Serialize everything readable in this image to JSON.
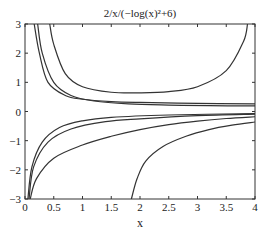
{
  "chart_data": {
    "type": "line",
    "title": "2/x/(−log(x)²+6)",
    "xlabel": "x",
    "ylabel": "",
    "xlim": [
      0,
      4
    ],
    "ylim": [
      -3,
      3
    ],
    "grid": false,
    "legend": null,
    "x_ticks": [
      "0",
      "0.5",
      "1",
      "1.5",
      "2",
      "2.5",
      "3",
      "3.5",
      "4"
    ],
    "y_ticks": [
      "3",
      "2",
      "1",
      "0",
      "−1",
      "−2",
      "−3"
    ],
    "series": [
      {
        "name": "curve-u",
        "points": [
          [
            0.43,
            3.0
          ],
          [
            0.5,
            2.3
          ],
          [
            0.7,
            1.3
          ],
          [
            1.0,
            0.85
          ],
          [
            1.5,
            0.66
          ],
          [
            2.0,
            0.64
          ],
          [
            2.5,
            0.68
          ],
          [
            3.0,
            0.85
          ],
          [
            3.5,
            1.4
          ],
          [
            3.8,
            2.4
          ],
          [
            3.87,
            3.0
          ]
        ]
      },
      {
        "name": "curve-upper-1",
        "points": [
          [
            0.16,
            3.0
          ],
          [
            0.25,
            2.0
          ],
          [
            0.4,
            1.0
          ],
          [
            0.7,
            0.55
          ],
          [
            1.0,
            0.42
          ],
          [
            1.5,
            0.34
          ],
          [
            2.0,
            0.31
          ],
          [
            3.0,
            0.28
          ],
          [
            4.0,
            0.26
          ]
        ]
      },
      {
        "name": "curve-upper-2",
        "points": [
          [
            0.22,
            3.0
          ],
          [
            0.3,
            2.0
          ],
          [
            0.5,
            1.0
          ],
          [
            0.8,
            0.55
          ],
          [
            1.2,
            0.36
          ],
          [
            1.8,
            0.26
          ],
          [
            2.5,
            0.22
          ],
          [
            3.2,
            0.2
          ],
          [
            4.0,
            0.19
          ]
        ]
      },
      {
        "name": "curve-lower-1",
        "points": [
          [
            0.05,
            -3.0
          ],
          [
            0.12,
            -1.9
          ],
          [
            0.3,
            -1.05
          ],
          [
            0.6,
            -0.55
          ],
          [
            1.0,
            -0.32
          ],
          [
            1.5,
            -0.2
          ],
          [
            2.5,
            -0.12
          ],
          [
            4.0,
            -0.07
          ]
        ]
      },
      {
        "name": "curve-lower-2",
        "points": [
          [
            0.07,
            -3.0
          ],
          [
            0.15,
            -1.9
          ],
          [
            0.4,
            -1.05
          ],
          [
            0.8,
            -0.6
          ],
          [
            1.4,
            -0.35
          ],
          [
            2.0,
            -0.25
          ],
          [
            3.0,
            -0.14
          ],
          [
            4.0,
            -0.09
          ]
        ]
      },
      {
        "name": "curve-lower-3",
        "points": [
          [
            0.09,
            -3.0
          ],
          [
            0.2,
            -2.3
          ],
          [
            0.5,
            -1.6
          ],
          [
            1.0,
            -1.15
          ],
          [
            1.5,
            -0.85
          ],
          [
            2.0,
            -0.62
          ],
          [
            2.5,
            -0.45
          ],
          [
            3.0,
            -0.33
          ],
          [
            3.5,
            -0.24
          ],
          [
            4.0,
            -0.18
          ]
        ]
      },
      {
        "name": "curve-lower-4",
        "points": [
          [
            1.85,
            -3.0
          ],
          [
            1.95,
            -2.3
          ],
          [
            2.1,
            -1.7
          ],
          [
            2.4,
            -1.2
          ],
          [
            2.8,
            -0.85
          ],
          [
            3.2,
            -0.62
          ],
          [
            3.6,
            -0.47
          ],
          [
            4.0,
            -0.36
          ]
        ]
      }
    ]
  },
  "plot": {
    "left": 25,
    "right": 255,
    "top": 24,
    "bottom": 199,
    "line_color": "#333333",
    "axis_color": "#333333"
  }
}
